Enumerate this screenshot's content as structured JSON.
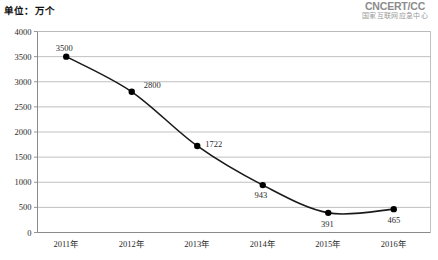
{
  "header": {
    "unit_label": "单位：万个",
    "logo": {
      "mark": "CNCERT/CC",
      "subtitle": "国家互联网应急中心",
      "color": "#8c8c8c"
    }
  },
  "chart_data": {
    "type": "line",
    "title": "",
    "subtitle": "",
    "xlabel": "",
    "ylabel": "",
    "unit": "万个",
    "categories": [
      "2011年",
      "2012年",
      "2013年",
      "2014年",
      "2015年",
      "2016年"
    ],
    "values": [
      3500,
      2800,
      1722,
      943,
      391,
      465
    ],
    "point_labels": [
      "3500",
      "2800",
      "1722",
      "943",
      "391",
      "465"
    ],
    "ylim": [
      0,
      4000
    ],
    "ytick_step": 500,
    "yticks": [
      0,
      500,
      1000,
      1500,
      2000,
      2500,
      3000,
      3500,
      4000
    ],
    "ytick_labels": [
      "0",
      "500",
      "1000",
      "1500",
      "2000",
      "2500",
      "3000",
      "3500",
      "4000"
    ],
    "grid": true,
    "grid_axis": "y",
    "legend": false,
    "legend_position": "none",
    "line_color": "#1a1a1a",
    "marker_color": "#000000",
    "grid_color": "#b9b9b9",
    "axis_color": "#8a8a8a",
    "background_color": "#ffffff",
    "marker": "circle",
    "smooth": true
  }
}
